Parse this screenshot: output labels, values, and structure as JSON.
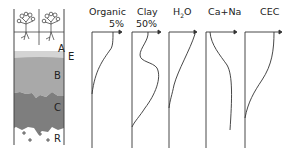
{
  "figure": {
    "horizons": [
      {
        "label": "A",
        "description": "topsoil with plants and roots"
      },
      {
        "label": "E",
        "description": "eluviated light layer"
      },
      {
        "label": "B",
        "description": "subsoil"
      },
      {
        "label": "C",
        "description": "weathered parent material"
      },
      {
        "label": "R",
        "description": "bedrock"
      }
    ],
    "columns": [
      {
        "label": "Organic",
        "scale": "5%"
      },
      {
        "label": "Clay",
        "scale": "50%"
      },
      {
        "label": "H2O_display",
        "scale": ""
      },
      {
        "label": "Ca+Na",
        "scale": ""
      },
      {
        "label": "CEC",
        "scale": ""
      }
    ],
    "h2o": {
      "main": "H",
      "sub": "2",
      "tail": "O"
    }
  },
  "colors": {
    "layer_A": "#ffffff",
    "layer_E": "#d4d4d4",
    "layer_B": "#a9a9a9",
    "layer_C": "#7e7e7e",
    "layer_R": "#ffffff",
    "line": "#222222"
  }
}
